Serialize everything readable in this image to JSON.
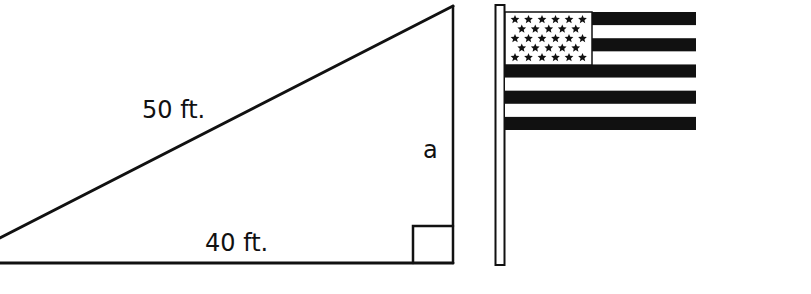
{
  "diagram": {
    "type": "right-triangle-flagpole",
    "triangle": {
      "hypotenuse_label": "50 ft.",
      "base_label": "40 ft.",
      "height_label": "a",
      "right_angle_marker": true
    },
    "flag": {
      "stripe_count": 9,
      "star_rows": [
        6,
        5,
        6,
        5,
        6
      ],
      "colors": {
        "ink": "#111111",
        "paper": "#ffffff"
      }
    }
  }
}
